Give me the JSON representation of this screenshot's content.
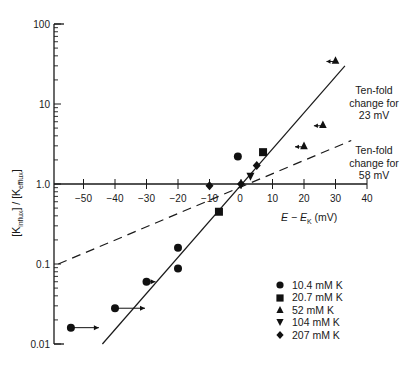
{
  "chart_data": {
    "type": "scatter",
    "title": "",
    "xlabel": "E − E_K (mV)",
    "ylabel": "[K influx] / [K efflux]",
    "xlabel_parts": {
      "e": "E",
      "minus": " − ",
      "ek": "E",
      "ek_sub": "K",
      "unit": " (mV)"
    },
    "ylabel_parts": {
      "a": "[K",
      "a_sub": "influx",
      "b": "] / [K",
      "b_sub": "efflux",
      "c": "]"
    },
    "y_scale": "log",
    "ylim": [
      0.01,
      100
    ],
    "xlim": [
      -55,
      40
    ],
    "x_ticks": [
      -50,
      -40,
      -30,
      -20,
      -10,
      0,
      10,
      20,
      30,
      40
    ],
    "x_tick_labels": [
      "−50",
      "−40",
      "−30",
      "−20",
      "−10",
      "0",
      "10",
      "20",
      "30",
      "40"
    ],
    "y_ticks": [
      0.01,
      0.1,
      1.0,
      10,
      100
    ],
    "y_tick_labels": [
      "0.01",
      "0.1",
      "1.0",
      "10",
      "100"
    ],
    "grid": false,
    "legend_position": "lower right",
    "series": [
      {
        "name": "10.4 mM K",
        "marker": "circle",
        "points": [
          {
            "x": -54,
            "y": 0.016,
            "arrow": "right"
          },
          {
            "x": -40,
            "y": 0.028,
            "arrow": "right"
          },
          {
            "x": -30,
            "y": 0.06,
            "arrow": "right"
          },
          {
            "x": -20,
            "y": 0.16
          },
          {
            "x": -20,
            "y": 0.088
          },
          {
            "x": -1,
            "y": 2.2
          }
        ]
      },
      {
        "name": "20.7 mM K",
        "marker": "square",
        "points": [
          {
            "x": -7,
            "y": 0.45
          },
          {
            "x": 7,
            "y": 2.5
          }
        ]
      },
      {
        "name": "52 mM K",
        "marker": "triangle-up",
        "points": [
          {
            "x": 20,
            "y": 3.0,
            "arrow": "left"
          },
          {
            "x": 26,
            "y": 5.5,
            "arrow": "left"
          },
          {
            "x": 30,
            "y": 35,
            "arrow": "left"
          }
        ]
      },
      {
        "name": "104 mM K",
        "marker": "triangle-down",
        "points": [
          {
            "x": 3,
            "y": 1.25
          }
        ]
      },
      {
        "name": "207 mM K",
        "marker": "diamond",
        "points": [
          {
            "x": -10,
            "y": 0.95
          },
          {
            "x": 0,
            "y": 1.0
          },
          {
            "x": 5,
            "y": 1.7
          }
        ]
      }
    ],
    "lines": [
      {
        "name": "Ten-fold change for 23 mV",
        "style": "solid",
        "x": [
          -44,
          33
        ],
        "y": [
          0.01,
          30
        ]
      },
      {
        "name": "Ten-fold change for 58 mV",
        "style": "dashed",
        "x": [
          -58,
          35
        ],
        "y": [
          0.1,
          3.5
        ]
      }
    ],
    "annotations": [
      {
        "lines": [
          "Ten-fold",
          "change for",
          "23 mV"
        ]
      },
      {
        "lines": [
          "Ten-fold",
          "change for",
          "58 mV"
        ]
      }
    ]
  }
}
